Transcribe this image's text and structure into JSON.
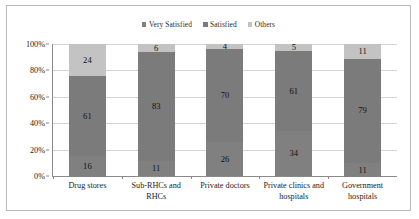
{
  "chart_data": {
    "type": "bar",
    "subtype": "100% stacked column",
    "title": "",
    "subtitle": "",
    "xlabel": "",
    "ylabel": "",
    "categories": [
      "Drug stores",
      "Sub-RHCs and RHCs",
      "Private doctors",
      "Private clinics and hospitals",
      "Government hospitals"
    ],
    "series": [
      {
        "name": "Very Satisfied",
        "values": [
          16,
          11,
          26,
          34,
          11
        ],
        "color": "#808080"
      },
      {
        "name": "Satisfied",
        "values": [
          61,
          83,
          70,
          61,
          79
        ],
        "color": "#7b7b7b"
      },
      {
        "name": "Others",
        "values": [
          24,
          6,
          4,
          5,
          11
        ],
        "color": "#c3c3c3"
      }
    ],
    "ylim": [
      0,
      100
    ],
    "yticks": [
      "0%",
      "20%",
      "40%",
      "60%",
      "80%",
      "100%"
    ],
    "ytick_values": [
      0,
      20,
      40,
      60,
      80,
      100
    ],
    "grid": true,
    "grid_axis": "y",
    "legend_position": "top-center",
    "value_labels": true
  },
  "legend": {
    "entries": [
      {
        "label": "Very Satisfied",
        "color": "#808080"
      },
      {
        "label": "Satisfied",
        "color": "#7b7b7b"
      },
      {
        "label": "Others",
        "color": "#c3c3c3"
      }
    ]
  },
  "axis": {
    "y_labels": [
      "100%",
      "80%",
      "60%",
      "40%",
      "20%",
      "0%"
    ]
  },
  "bars": [
    {
      "category": "Drug stores",
      "category_line1": "Drug stores",
      "category_line2": "",
      "segments": [
        {
          "series": "Others",
          "value": 24,
          "label": "24"
        },
        {
          "series": "Satisfied",
          "value": 61,
          "label": "61"
        },
        {
          "series": "Very Satisfied",
          "value": 16,
          "label": "16"
        }
      ]
    },
    {
      "category": "Sub-RHCs and RHCs",
      "category_line1": "Sub-RHCs and",
      "category_line2": "RHCs",
      "segments": [
        {
          "series": "Others",
          "value": 6,
          "label": "6"
        },
        {
          "series": "Satisfied",
          "value": 83,
          "label": "83"
        },
        {
          "series": "Very Satisfied",
          "value": 11,
          "label": "11"
        }
      ]
    },
    {
      "category": "Private doctors",
      "category_line1": "Private doctors",
      "category_line2": "",
      "segments": [
        {
          "series": "Others",
          "value": 4,
          "label": "4"
        },
        {
          "series": "Satisfied",
          "value": 70,
          "label": "70"
        },
        {
          "series": "Very Satisfied",
          "value": 26,
          "label": "26"
        }
      ]
    },
    {
      "category": "Private clinics and hospitals",
      "category_line1": "Private clinics and",
      "category_line2": "hospitals",
      "segments": [
        {
          "series": "Others",
          "value": 5,
          "label": "5"
        },
        {
          "series": "Satisfied",
          "value": 61,
          "label": "61"
        },
        {
          "series": "Very Satisfied",
          "value": 34,
          "label": "34"
        }
      ]
    },
    {
      "category": "Government hospitals",
      "category_line1": "Government",
      "category_line2": "hospitals",
      "segments": [
        {
          "series": "Others",
          "value": 11,
          "label": "11"
        },
        {
          "series": "Satisfied",
          "value": 79,
          "label": "79"
        },
        {
          "series": "Very Satisfied",
          "value": 11,
          "label": "11"
        }
      ]
    }
  ]
}
